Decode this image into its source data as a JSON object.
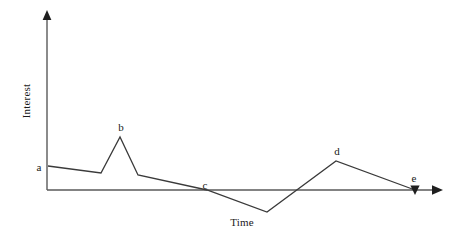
{
  "chart_data": {
    "type": "line",
    "title": "",
    "subtitle": "",
    "xlabel": "Time",
    "ylabel": "Interest",
    "grid": false,
    "legend": null,
    "axes": {
      "x_axis_style": "arrow",
      "y_axis_style": "arrow",
      "x_ticks": [],
      "y_ticks": [],
      "x_origin_px": 47,
      "y_baseline_px": 190,
      "x_arrow_tip_px": 443,
      "y_arrow_tip_px": 11,
      "description": "Unscaled schematic axes with arrowheads; no numeric tick labels"
    },
    "line_color": "#3a3a3a",
    "axis_color": "#5a5a5a",
    "series": [
      {
        "name": "Interest",
        "points": [
          {
            "label": "a",
            "x_px": 48,
            "y_px": 166,
            "x": 0.0,
            "y": 0.45,
            "note": "start, moderate interest"
          },
          {
            "label": "",
            "x_px": 101,
            "y_px": 173,
            "x": 0.13,
            "y": 0.36,
            "note": "slow decline"
          },
          {
            "label": "b",
            "x_px": 120,
            "y_px": 137,
            "x": 0.18,
            "y": 0.8,
            "note": "sharp spike peak"
          },
          {
            "label": "",
            "x_px": 138,
            "y_px": 175,
            "x": 0.23,
            "y": 0.34,
            "note": "sharp drop back"
          },
          {
            "label": "c",
            "x_px": 207,
            "y_px": 190,
            "x": 0.4,
            "y": 0.0,
            "note": "crosses zero axis"
          },
          {
            "label": "",
            "x_px": 267,
            "y_px": 212,
            "x": 0.56,
            "y": -0.27,
            "note": "trough, minimum"
          },
          {
            "label": "d",
            "x_px": 336,
            "y_px": 161,
            "x": 0.73,
            "y": 0.35,
            "note": "second rounded peak"
          },
          {
            "label": "e",
            "x_px": 415,
            "y_px": 190,
            "x": 0.93,
            "y": 0.0,
            "note": "end, returns to zero"
          }
        ]
      }
    ],
    "point_labels": [
      {
        "id": "a",
        "text": "a",
        "x_px": 39,
        "y_px": 167
      },
      {
        "id": "b",
        "text": "b",
        "x_px": 121,
        "y_px": 127
      },
      {
        "id": "c",
        "text": "c",
        "x_px": 205,
        "y_px": 185
      },
      {
        "id": "d",
        "text": "d",
        "x_px": 337,
        "y_px": 151
      },
      {
        "id": "e",
        "text": "e",
        "x_px": 414,
        "y_px": 178
      }
    ],
    "markers": [
      {
        "id": "e-marker",
        "shape": "filled-triangle",
        "x_px": 415,
        "y_px": 191
      }
    ],
    "annotations": []
  }
}
